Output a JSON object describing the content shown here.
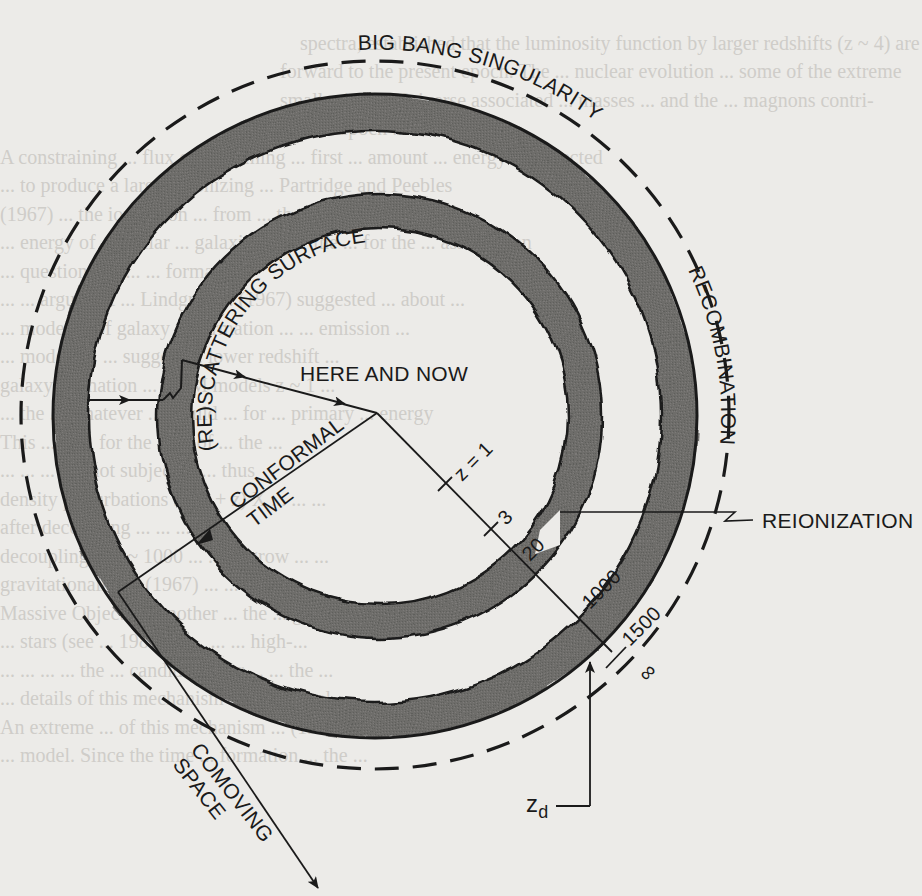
{
  "figure": {
    "type": "conformal spacetime diagram",
    "labels": {
      "big_bang": "BIG BANG SINGULARITY",
      "rescattering": "(RE)SCATTERING SURFACE",
      "recombination": "RECOMBINATION",
      "here_and_now": "HERE AND NOW",
      "conformal": "CONFORMAL",
      "time": "TIME",
      "reionization": "REIONIZATION",
      "comoving": "COMOVING",
      "space": "SPACE",
      "z_d": "z",
      "z_d_sub": "d"
    },
    "redshift_ticks": [
      {
        "label": "z = 1"
      },
      {
        "label": "3"
      },
      {
        "label": "20"
      },
      {
        "label": "1000"
      },
      {
        "label": "1500"
      },
      {
        "label": "∞"
      }
    ],
    "colors": {
      "ink": "#1a1a1a",
      "ring_fill": "#6e6d6b",
      "paper": "#ecebe8",
      "bleed_text": "#cfcdc9"
    }
  },
  "background_text": {
    "lines": [
      "",
      "spectra, established that the luminosity function by larger redshifts (z ~ 4) are",
      "forward to the present epoch. The ... nuclear evolution ... some of the extreme",
      "smaller in the Universe associated ... masses ... and the ... magnons contri-",
      "ever ... epoch ... ionization ...",
      "   A constraining ... flux of ... forming ... first ... amount ... energy ... expected",
      "  ... to produce a large ... ionizing ... Partridge and Peebles",
      "(1967) ... the ionization ... from ... the ... mixture",
      "... energy of ... stellar ... galaxies ... for the ... for the ... assumption",
      "... questions. ... ... ... formation",
      "... ...  argument ... Lindgren ... (1967) suggested ... about ...",
      "... model ... of galaxy ... formation ... ... emission ...",
      "... models ... ... suggest ... lower redshift ... ",
      "galaxy formation ... CDM models z ~ 1 ...",
      "   ... the ... whatever ... would ... for ... primary ... energy",
      "This ... is ... for the ... ...  of ... the ...",
      "... ... ... are not subject ... ... thus",
      "density perturbations ... (1 + z) X ... ... ...",
      "after decoupling ... ... ... ... ...",
      "decoupling at z ~ 1000 ... ... ... grow ... ...",
      "gravitationally. ... (1967) ... ... ...",
      "Massive Objects ... another ... the ... generation of pro-",
      "... stars (see ... 1984) ... ... ... ... high-...",
      "... ... ... ... the ... candidate. For ... ... the ...",
      "... details of this mechanism ... Bond et al. ...",
      "   An extreme ... of this mechanism ... (1984) ... ",
      "... model. Since the time ... formation ... the ..."
    ]
  }
}
